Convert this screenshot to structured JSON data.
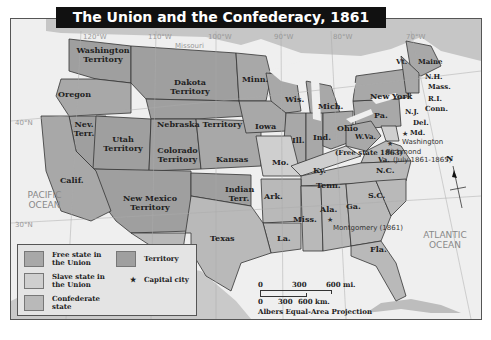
{
  "title": "The Union and the Confederacy, 1861",
  "colors": {
    "free_state": "#a8a8a8",
    "slave_state_union": "#cfcfcf",
    "confederate_state": "#b9b9b9",
    "territory": "#9f9f9f",
    "water": "#efefef",
    "title_bg": "#111111"
  },
  "grid_labels": {
    "lon_120": "120°W",
    "lon_110": "110°W",
    "lon_100": "100°W",
    "lon_90": "90°W",
    "lon_80": "80°W",
    "lon_70": "70°W",
    "lat_40": "40°N",
    "lat_30": "30°N"
  },
  "oceans": {
    "pacific": "PACIFIC OCEAN",
    "atlantic": "ATLANTIC OCEAN"
  },
  "rivers": {
    "missouri": "Missouri"
  },
  "regions": {
    "washington_territory": "Washington Territory",
    "oregon": "Oregon",
    "dakota_territory": "Dakota Territory",
    "minn": "Minn.",
    "wis": "Wis.",
    "mich": "Mich.",
    "iowa": "Iowa",
    "ill": "Ill.",
    "ind": "Ind.",
    "ohio": "Ohio",
    "pa": "Pa.",
    "new_york": "New York",
    "vt": "Vt.",
    "maine": "Maine",
    "nh": "N.H.",
    "mass": "Mass.",
    "ri": "R.I.",
    "conn": "Conn.",
    "nj": "N.J.",
    "del": "Del.",
    "md": "Md.",
    "wva": "W.Va.",
    "wva_note": "(Free state 1863)",
    "va": "Va.",
    "nev_terr": "Nev. Terr.",
    "utah_territory": "Utah Territory",
    "nebraska_territory": "Nebraska Territory",
    "colorado_territory": "Colorado Territory",
    "kansas": "Kansas",
    "mo": "Mo.",
    "ky": "Ky.",
    "calif": "Calif.",
    "new_mexico_territory": "New Mexico Territory",
    "indian_terr": "Indian Terr.",
    "ark": "Ark.",
    "tenn": "Tenn.",
    "nc": "N.C.",
    "sc": "S.C.",
    "ga": "Ga.",
    "ala": "Ala.",
    "miss": "Miss.",
    "la": "La.",
    "texas": "Texas",
    "fla": "Fla."
  },
  "cities": {
    "washington": "Washington",
    "richmond": "Richmond",
    "richmond_note": "(July 1861-1865)",
    "montgomery": "Montgomery (1861)"
  },
  "legend": {
    "free_state": "Free state in the Union",
    "slave_state": "Slave state in the Union",
    "confederate": "Confederate state",
    "territory": "Territory",
    "capital": "Capital city",
    "capital_symbol": "★"
  },
  "scale": {
    "mi_0": "0",
    "mi_300": "300",
    "mi_600": "600 mi.",
    "km_0": "0",
    "km_300": "300",
    "km_600": "600 km.",
    "projection": "Albers Equal-Area Projection"
  },
  "compass": {
    "north": "N"
  }
}
